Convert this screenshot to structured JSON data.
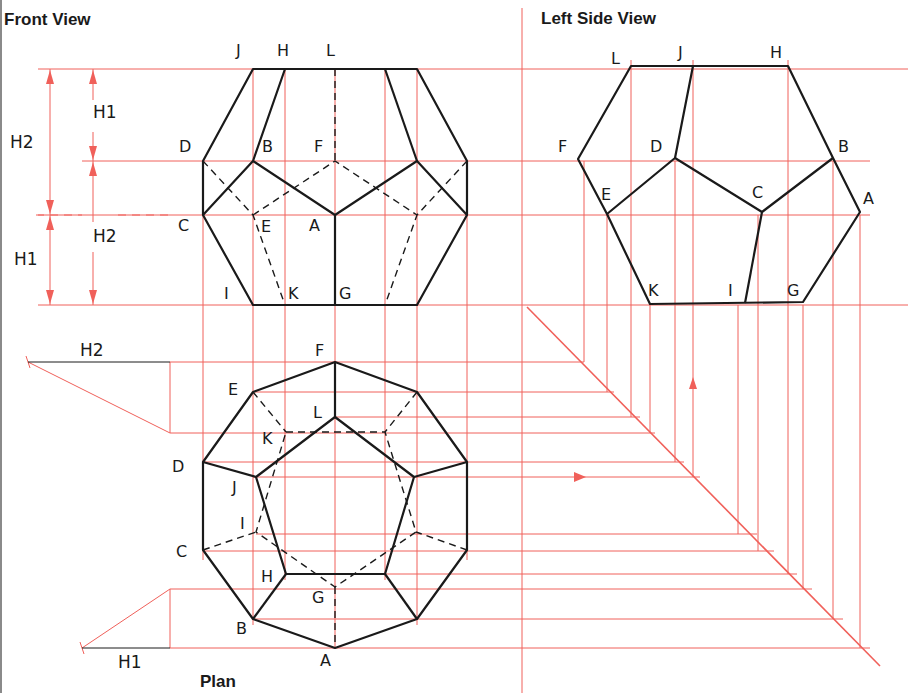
{
  "titles": {
    "front": "Front View",
    "side": "Left Side View",
    "plan": "Plan"
  },
  "dimensions": {
    "h1": "H1",
    "h2": "H2"
  },
  "front_labels": {
    "J": "J",
    "H": "H",
    "L": "L",
    "D": "D",
    "B": "B",
    "F": "F",
    "C": "C",
    "E": "E",
    "A": "A",
    "I": "I",
    "K": "K",
    "G": "G"
  },
  "side_labels": {
    "L": "L",
    "J": "J",
    "H": "H",
    "F": "F",
    "D": "D",
    "B": "B",
    "E": "E",
    "C": "C",
    "A": "A",
    "K": "K",
    "I": "I",
    "G": "G"
  },
  "plan_labels": {
    "F": "F",
    "E": "E",
    "L": "L",
    "K": "K",
    "D": "D",
    "J": "J",
    "I": "I",
    "C": "C",
    "H": "H",
    "G": "G",
    "B": "B",
    "A": "A"
  },
  "colors": {
    "construction": "#f0605a",
    "object": "#1a1a1a",
    "background": "#ffffff"
  }
}
